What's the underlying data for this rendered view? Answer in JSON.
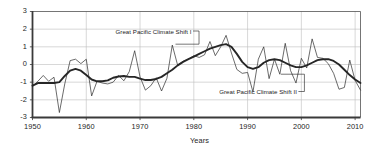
{
  "chart_data": {
    "type": "line",
    "title": "",
    "subtitle": "",
    "xlabel": "Years",
    "ylabel": "",
    "xlim": [
      1950,
      2011
    ],
    "ylim": [
      -3,
      3
    ],
    "grid": true,
    "legend_position": "none",
    "y_ticks": [
      3,
      2,
      1,
      0,
      -1,
      -2,
      -3
    ],
    "y_tick_labels": [
      "3",
      "2",
      "1",
      "0",
      "-1",
      "-2",
      "-3"
    ],
    "x_ticks": [
      1950,
      1960,
      1970,
      1980,
      1990,
      2000,
      2010
    ],
    "x_tick_labels": [
      "1950",
      "1960",
      "1970",
      "1980",
      "1990",
      "2000",
      "2010"
    ],
    "x": [
      1950,
      1951,
      1952,
      1953,
      1954,
      1955,
      1956,
      1957,
      1958,
      1959,
      1960,
      1961,
      1962,
      1963,
      1964,
      1965,
      1966,
      1967,
      1968,
      1969,
      1970,
      1971,
      1972,
      1973,
      1974,
      1975,
      1976,
      1977,
      1978,
      1979,
      1980,
      1981,
      1982,
      1983,
      1984,
      1985,
      1986,
      1987,
      1988,
      1989,
      1990,
      1991,
      1992,
      1993,
      1994,
      1995,
      1996,
      1997,
      1998,
      1999,
      2000,
      2001,
      2002,
      2003,
      2004,
      2005,
      2006,
      2007,
      2008,
      2009,
      2010,
      2011
    ],
    "series": [
      {
        "name": "Annual index",
        "style": "thin",
        "color": "#2b2b2b",
        "line_width": 0.7,
        "values": [
          -1.25,
          -0.95,
          -0.62,
          -0.95,
          -0.72,
          -2.72,
          -1.1,
          0.22,
          0.3,
          0.05,
          0.3,
          -1.78,
          -0.95,
          -1.05,
          -1.1,
          -1.0,
          -0.62,
          -0.92,
          -0.4,
          0.78,
          -0.7,
          -1.45,
          -1.2,
          -0.75,
          -1.5,
          -0.78,
          1.1,
          -0.05,
          0.18,
          0.3,
          0.5,
          0.4,
          0.55,
          1.3,
          0.5,
          1.0,
          1.65,
          0.65,
          -0.28,
          -0.5,
          -0.45,
          -1.55,
          0.3,
          1.0,
          -0.8,
          0.3,
          -0.55,
          1.2,
          -0.35,
          -1.05,
          0.35,
          -0.2,
          1.45,
          0.4,
          0.35,
          0.05,
          -0.5,
          -1.4,
          -1.3,
          0.25,
          -0.9,
          -1.45
        ]
      },
      {
        "name": "Smoothed trend",
        "style": "thick",
        "color": "#262626",
        "line_width": 1.9,
        "values": [
          -1.2,
          -1.05,
          -1.05,
          -1.05,
          -1.05,
          -1.0,
          -0.65,
          -0.35,
          -0.25,
          -0.35,
          -0.6,
          -0.85,
          -0.95,
          -0.95,
          -0.9,
          -0.75,
          -0.68,
          -0.65,
          -0.7,
          -0.7,
          -0.8,
          -0.88,
          -0.88,
          -0.82,
          -0.7,
          -0.5,
          -0.3,
          -0.05,
          0.15,
          0.3,
          0.45,
          0.6,
          0.75,
          0.9,
          1.0,
          1.1,
          1.15,
          1.0,
          0.6,
          0.15,
          -0.15,
          -0.25,
          -0.15,
          0.1,
          0.25,
          0.3,
          0.25,
          0.1,
          -0.05,
          -0.15,
          -0.15,
          -0.05,
          0.1,
          0.25,
          0.3,
          0.3,
          0.2,
          0.0,
          -0.3,
          -0.6,
          -0.85,
          -1.05
        ]
      }
    ],
    "annotations": [
      {
        "id": "shift-1",
        "text": "Great Pacific Climate Shift I",
        "target_year": 1976.6,
        "target_value": 1.15
      },
      {
        "id": "shift-2",
        "text": "Great Pacific Climate Shift II",
        "target_year": 1996.2,
        "target_value": -0.55
      }
    ],
    "colors": {
      "axis": "#3a3a3a",
      "grid": "#bdbdbd",
      "annotation": "#1a1a1a",
      "background": "#ffffff"
    }
  }
}
